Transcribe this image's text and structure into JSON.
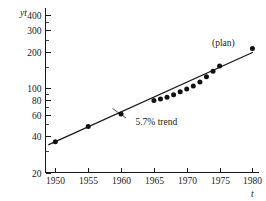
{
  "chart_data": {
    "type": "scatter",
    "title": "",
    "xlabel": "t",
    "ylabel": "yt",
    "yscale": "log",
    "xscale": "linear",
    "xlim": [
      1948.5,
      1981
    ],
    "ylim": [
      20,
      460
    ],
    "grid": false,
    "legend": null,
    "y_ticks": [
      20,
      40,
      60,
      80,
      100,
      200,
      300,
      400
    ],
    "y_tick_labels": [
      "20",
      "40",
      "60",
      "80",
      "100",
      "200",
      "300",
      "400"
    ],
    "y_minor_ticks": [
      30,
      50,
      70,
      90,
      150,
      250,
      350
    ],
    "x_ticks": [
      1950,
      1955,
      1960,
      1965,
      1970,
      1975,
      1980
    ],
    "x_tick_labels": [
      "1950",
      "1955",
      "1960",
      "1965",
      "1970",
      "1975",
      "1980"
    ],
    "series": [
      {
        "name": "observed",
        "marker": "filled-circle",
        "x": [
          1950,
          1955,
          1960,
          1965,
          1966,
          1967,
          1968,
          1969,
          1970,
          1971,
          1972,
          1973,
          1974,
          1975
        ],
        "y": [
          36,
          48,
          61,
          79,
          81,
          84,
          88,
          93,
          98,
          104,
          112,
          124,
          138,
          152
        ]
      },
      {
        "name": "plan",
        "marker": "filled-circle",
        "x": [
          1980
        ],
        "y": [
          213
        ]
      }
    ],
    "trend": {
      "name": "5.7% trend",
      "growth_rate_percent": 5.7,
      "x": [
        1949,
        1980
      ],
      "y": [
        34,
        197
      ]
    },
    "annotations": [
      {
        "name": "trend-label",
        "text": "5.7% trend",
        "x": 1962.2,
        "y": 49
      },
      {
        "name": "plan-label",
        "text": "(plan)",
        "x": 1977.3,
        "y": 225
      }
    ]
  },
  "axis": {
    "y_label": "yt",
    "x_label": "t"
  }
}
